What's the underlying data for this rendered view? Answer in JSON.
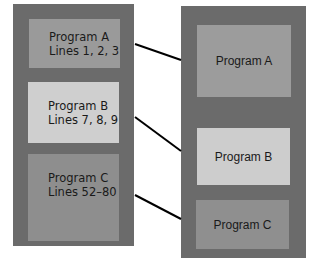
{
  "colors": {
    "container": "#6b6b6b",
    "program_a": "#9a9a9a",
    "program_b": "#cfcfcf",
    "program_c": "#8e8e8e",
    "right_a": "#9c9c9c",
    "right_b": "#cdcdcd",
    "right_c": "#8f8f8f",
    "link": "#000000"
  },
  "left": {
    "items": [
      {
        "title": "Program A",
        "detail": "Lines 1, 2, 3"
      },
      {
        "title": "Program B",
        "detail": "Lines 7, 8, 9"
      },
      {
        "title": "Program C",
        "detail": "Lines 52–80"
      }
    ]
  },
  "right": {
    "items": [
      {
        "title": "Program A"
      },
      {
        "title": "Program B"
      },
      {
        "title": "Program C"
      }
    ]
  },
  "links": [
    {
      "from": "Program A",
      "to": "Program A"
    },
    {
      "from": "Program B",
      "to": "Program B"
    },
    {
      "from": "Program C",
      "to": "Program C"
    }
  ]
}
